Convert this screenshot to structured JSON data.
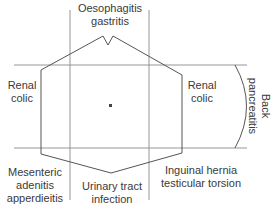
{
  "diagram": {
    "regions": {
      "top": [
        "Oesophagitis",
        "gastritis"
      ],
      "left": [
        "Renal",
        "colic"
      ],
      "right": [
        "Renal",
        "colic"
      ],
      "back": [
        "Back",
        "pancreatitis"
      ],
      "bottom_left": [
        "Mesenteric",
        "adenitis",
        "apperdieitis"
      ],
      "bottom_center": [
        "Urinary tract",
        "infection"
      ],
      "bottom_right": [
        "Inguinal hernia",
        "testicular torsion"
      ]
    },
    "center_marker": "umbilicus-dot",
    "colors": {
      "line": "#555555",
      "grid": "#8a8a8a",
      "text": "#3a3a3a"
    }
  }
}
